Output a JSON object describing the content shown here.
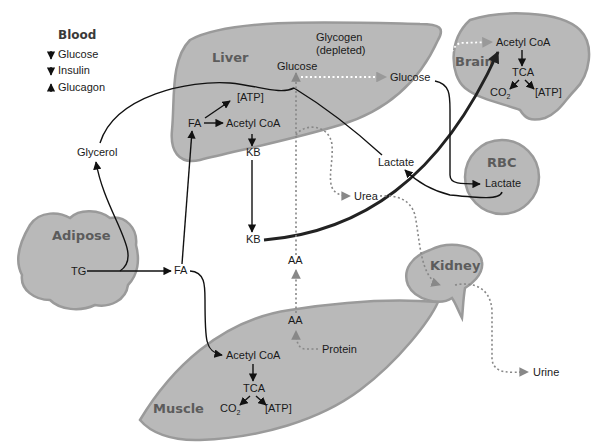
{
  "legend": {
    "title": "Blood",
    "items": [
      {
        "direction": "down",
        "label": "Glucose"
      },
      {
        "direction": "down",
        "label": "Insulin"
      },
      {
        "direction": "up",
        "label": "Glucagon"
      }
    ]
  },
  "organs": {
    "liver": {
      "label": "Liver",
      "glycogen": "Glycogen",
      "glycogen_state": "(depleted)",
      "glucose": "Glucose",
      "atp": "[ATP]",
      "fa": "FA",
      "acetyl_coa": "Acetyl CoA",
      "kb": "KB"
    },
    "brain": {
      "label": "Brain",
      "acetyl_coa": "Acetyl CoA",
      "tca": "TCA",
      "co2": "CO",
      "co2_sub": "2",
      "atp": "[ATP]"
    },
    "rbc": {
      "label": "RBC",
      "lactate": "Lactate"
    },
    "adipose": {
      "label": "Adipose",
      "tg": "TG"
    },
    "kidney": {
      "label": "Kidney"
    },
    "muscle": {
      "label": "Muscle",
      "acetyl_coa": "Acetyl CoA",
      "tca": "TCA",
      "co2": "CO",
      "co2_sub": "2",
      "atp": "[ATP]",
      "aa": "AA",
      "protein": "Protein"
    }
  },
  "blood_nodes": {
    "glucose": "Glucose",
    "glycerol": "Glycerol",
    "lactate": "Lactate",
    "urea": "Urea",
    "kb": "KB",
    "fa": "FA",
    "aa": "AA",
    "urine": "Urine"
  },
  "colors": {
    "organ_fill": "#b9b9b9",
    "organ_label": "#5c5c5c",
    "solid_arrow": "#111111",
    "dotted_arrow": "#888888"
  }
}
